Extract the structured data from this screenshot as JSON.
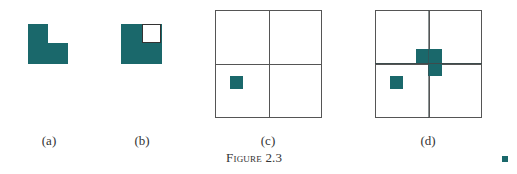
{
  "figure": {
    "caption": "Figure 2.3",
    "colors": {
      "fill": "#1a686b",
      "line": "#555555",
      "background": "#ffffff"
    },
    "panels": [
      {
        "id": "a",
        "label": "(a)",
        "description": "L-shaped region of three filled cells (2x2 block missing top-right cell)"
      },
      {
        "id": "b",
        "label": "(b)",
        "description": "2x2 block with top-right cell outlined white (completing square)"
      },
      {
        "id": "c",
        "label": "(c)",
        "description": "Square divided into four quadrants with a small filled square in the lower-left quadrant"
      },
      {
        "id": "d",
        "label": "(d)",
        "description": "Same quadrant grid with small square in lower-left quadrant plus an L-shaped triomino of small squares at the center"
      }
    ],
    "end_marker": "filled small square"
  }
}
